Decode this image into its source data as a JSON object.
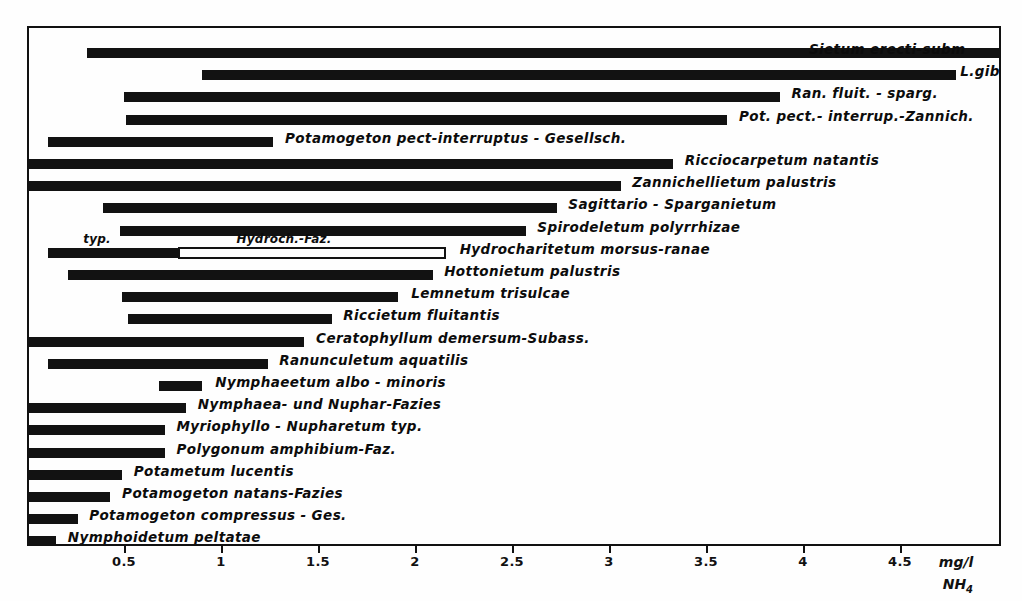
{
  "chart_data": {
    "type": "bar",
    "orientation": "horizontal",
    "title": "",
    "xlabel": "mg/l NH4",
    "ylabel": "",
    "xlim": [
      0,
      5.0
    ],
    "grid": false,
    "legend": null,
    "axis": {
      "unit_line1": "mg/l",
      "unit_line2": "NH",
      "unit_sub": "4",
      "ticks": [
        {
          "label": "0.5",
          "value": 0.5
        },
        {
          "label": "1",
          "value": 1.0
        },
        {
          "label": "1.5",
          "value": 1.5
        },
        {
          "label": "2",
          "value": 2.0
        },
        {
          "label": "2.5",
          "value": 2.5
        },
        {
          "label": "3",
          "value": 3.0
        },
        {
          "label": "3.5",
          "value": 3.5
        },
        {
          "label": "4",
          "value": 4.0
        },
        {
          "label": "4.5",
          "value": 4.5
        }
      ]
    },
    "note": "Each bar is a horizontal range (min-max mg/l NH4) for a plant community. Top two bars are clipped at the right plot border.",
    "bars": [
      {
        "label": "Sietum erecti-subm",
        "start": 0.3,
        "end": 5.02,
        "label_pos": 4.02,
        "label_align": "above",
        "style": "filled",
        "clipped": true
      },
      {
        "label": "L.gibb",
        "start": 0.89,
        "end": 4.78,
        "label_pos": 4.8,
        "label_align": "right",
        "style": "filled",
        "clipped": true
      },
      {
        "label": "Ran. fluit. - sparg.",
        "start": 0.49,
        "end": 3.87,
        "label_pos": 3.93,
        "label_align": "right",
        "style": "filled",
        "clipped": false
      },
      {
        "label": "Pot. pect.- interrup.-Zannich.",
        "start": 0.5,
        "end": 3.6,
        "label_pos": 3.66,
        "label_align": "right",
        "style": "filled",
        "clipped": false
      },
      {
        "label": "Potamogeton pect-interruptus - Gesellsch.",
        "start": 0.1,
        "end": 1.26,
        "label_pos": 1.32,
        "label_align": "right",
        "style": "filled",
        "clipped": false
      },
      {
        "label": "Ricciocarpetum natantis",
        "start": 0.0,
        "end": 3.32,
        "label_pos": 3.38,
        "label_align": "right",
        "style": "filled",
        "clipped": false
      },
      {
        "label": "Zannichellietum palustris",
        "start": 0.0,
        "end": 3.05,
        "label_pos": 3.11,
        "label_align": "right",
        "style": "filled",
        "clipped": false
      },
      {
        "label": "Sagittario - Sparganietum",
        "start": 0.38,
        "end": 2.72,
        "label_pos": 2.78,
        "label_align": "right",
        "style": "filled",
        "clipped": false
      },
      {
        "label": "Spirodeletum polyrrhizae",
        "start": 0.47,
        "end": 2.56,
        "label_pos": 2.62,
        "label_align": "right",
        "style": "filled",
        "clipped": false
      },
      {
        "label": "Hydrocharitetum morsus-ranae",
        "start": 0.1,
        "end": 2.15,
        "label_pos": 2.22,
        "label_align": "right",
        "style": "split",
        "split_at": 0.77,
        "sub_labels": [
          {
            "text": "typ.",
            "pos": 0.28,
            "align": "above"
          },
          {
            "text": "Hydroch.-Faz.",
            "pos": 1.07,
            "align": "above"
          }
        ]
      },
      {
        "label": "Hottonietum palustris",
        "start": 0.2,
        "end": 2.08,
        "label_pos": 2.14,
        "label_align": "right",
        "style": "filled",
        "clipped": false
      },
      {
        "label": "Lemnetum trisulcae",
        "start": 0.48,
        "end": 1.9,
        "label_pos": 1.97,
        "label_align": "right",
        "style": "filled",
        "clipped": false
      },
      {
        "label": "Riccietum fluitantis",
        "start": 0.51,
        "end": 1.56,
        "label_pos": 1.62,
        "label_align": "right",
        "style": "filled",
        "clipped": false
      },
      {
        "label": "Ceratophyllum demersum-Subass.",
        "start": 0.0,
        "end": 1.42,
        "label_pos": 1.48,
        "label_align": "right",
        "style": "filled",
        "clipped": false
      },
      {
        "label": "Ranunculetum aquatilis",
        "start": 0.1,
        "end": 1.23,
        "label_pos": 1.29,
        "label_align": "right",
        "style": "filled",
        "clipped": false
      },
      {
        "label": "Nymphaeetum albo - minoris",
        "start": 0.67,
        "end": 0.89,
        "label_pos": 0.96,
        "label_align": "right",
        "style": "filled",
        "clipped": false
      },
      {
        "label": "Nymphaea- und Nuphar-Fazies",
        "start": 0.0,
        "end": 0.81,
        "label_pos": 0.87,
        "label_align": "right",
        "style": "filled",
        "clipped": false
      },
      {
        "label": "Myriophyllo - Nupharetum typ.",
        "start": 0.0,
        "end": 0.7,
        "label_pos": 0.76,
        "label_align": "right",
        "style": "filled",
        "clipped": false
      },
      {
        "label": "Polygonum amphibium-Faz.",
        "start": 0.0,
        "end": 0.7,
        "label_pos": 0.76,
        "label_align": "right",
        "style": "filled",
        "clipped": false
      },
      {
        "label": "Potametum lucentis",
        "start": 0.0,
        "end": 0.48,
        "label_pos": 0.54,
        "label_align": "right",
        "style": "filled",
        "clipped": false
      },
      {
        "label": "Potamogeton natans-Fazies",
        "start": 0.0,
        "end": 0.42,
        "label_pos": 0.48,
        "label_align": "right",
        "style": "filled",
        "clipped": false
      },
      {
        "label": "Potamogeton compressus - Ges.",
        "start": 0.0,
        "end": 0.25,
        "label_pos": 0.31,
        "label_align": "right",
        "style": "filled",
        "clipped": false
      },
      {
        "label": "Nymphoidetum peltatae",
        "start": 0.0,
        "end": 0.14,
        "label_pos": 0.2,
        "label_align": "right",
        "style": "filled",
        "clipped": false
      }
    ]
  }
}
